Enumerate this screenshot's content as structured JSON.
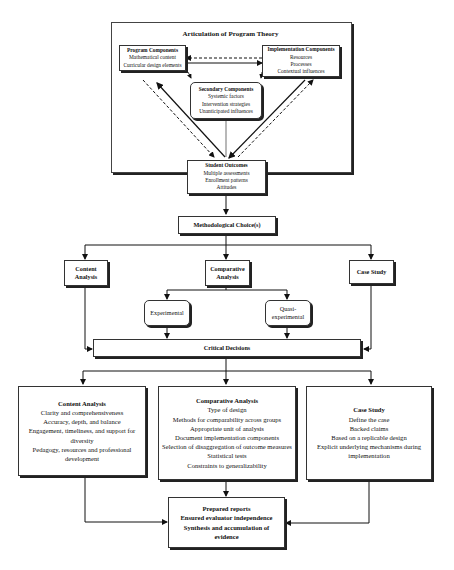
{
  "title": "Articulation of Program Theory",
  "theory": {
    "program_components": {
      "title": "Program Components",
      "items": [
        "Mathematical content",
        "Curricular design elements"
      ]
    },
    "implementation_components": {
      "title": "Implementation Components",
      "items": [
        "Resources",
        "Processes",
        "Contextual influences"
      ]
    },
    "secondary_components": {
      "title": "Secondary Components",
      "items": [
        "Systemic factors",
        "Intervention strategies",
        "Unanticipated influences"
      ]
    },
    "student_outcomes": {
      "title": "Student Outcomes",
      "items": [
        "Multiple assessments",
        "Enrollment patterns",
        "Attitudes"
      ]
    }
  },
  "methodological_choice": "Methodological Choice(s)",
  "methods": {
    "content_analysis": [
      "Content",
      "Analysis"
    ],
    "comparative_analysis": [
      "Comparative",
      "Analysis"
    ],
    "case_study": "Case Study",
    "experimental": "Experimental",
    "quasi_experimental": [
      "Quasi-",
      "experimental"
    ]
  },
  "critical_decisions": "Critical Decisions",
  "decisions": {
    "content_analysis": {
      "title": "Content Analysis",
      "items": [
        "Clarity and comprehensiveness",
        "Accuracy, depth, and balance",
        "Engagement, timeliness, and support for diversity",
        "Pedagogy, resources and professional development"
      ]
    },
    "comparative_analysis": {
      "title": "Comparative Analysis",
      "items": [
        "Type of design",
        "Methods for comparability across groups",
        "Appropriate unit of analysis",
        "Document implementation components",
        "Selection of disaggregation of outcome measures",
        "Statistical tests",
        "Constraints to generalizability"
      ]
    },
    "case_study": {
      "title": "Case Study",
      "items": [
        "Define the case",
        "Backed claims",
        "Based on a replicable design",
        "Explicit underlying mechanisms during implementation"
      ]
    }
  },
  "final": {
    "items": [
      "Prepared reports",
      "Ensured evaluator independence",
      "Synthesis and accumulation of evidence"
    ]
  }
}
